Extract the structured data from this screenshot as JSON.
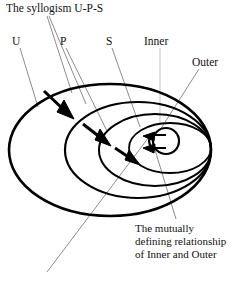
{
  "figure": {
    "title": "The syllogism U-P-S",
    "labels": {
      "u": "U",
      "p": "P",
      "s": "S",
      "inner": "Inner",
      "outer": "Outer"
    },
    "caption": {
      "line1": "The mutually",
      "line2": "defining relationship",
      "line3": "of Inner and Outer"
    },
    "colors": {
      "stroke": "#000000",
      "leader": "#6f6f6f",
      "background": "#ffffff"
    },
    "shapes": {
      "ellipse_outer_label": "outer-ellipse",
      "ellipse_second_label": "second-ellipse",
      "ellipse_third_label": "third-ellipse",
      "ellipse_fourth_label": "fourth-ellipse",
      "center_circle_label": "center-circle"
    },
    "arrows": {
      "arrow_1": "arrow-outer-to-second",
      "arrow_2": "arrow-second-to-third",
      "arrow_3": "arrow-third-to-center",
      "arrow_mutual": "double-headed-mutual-arrow"
    }
  }
}
